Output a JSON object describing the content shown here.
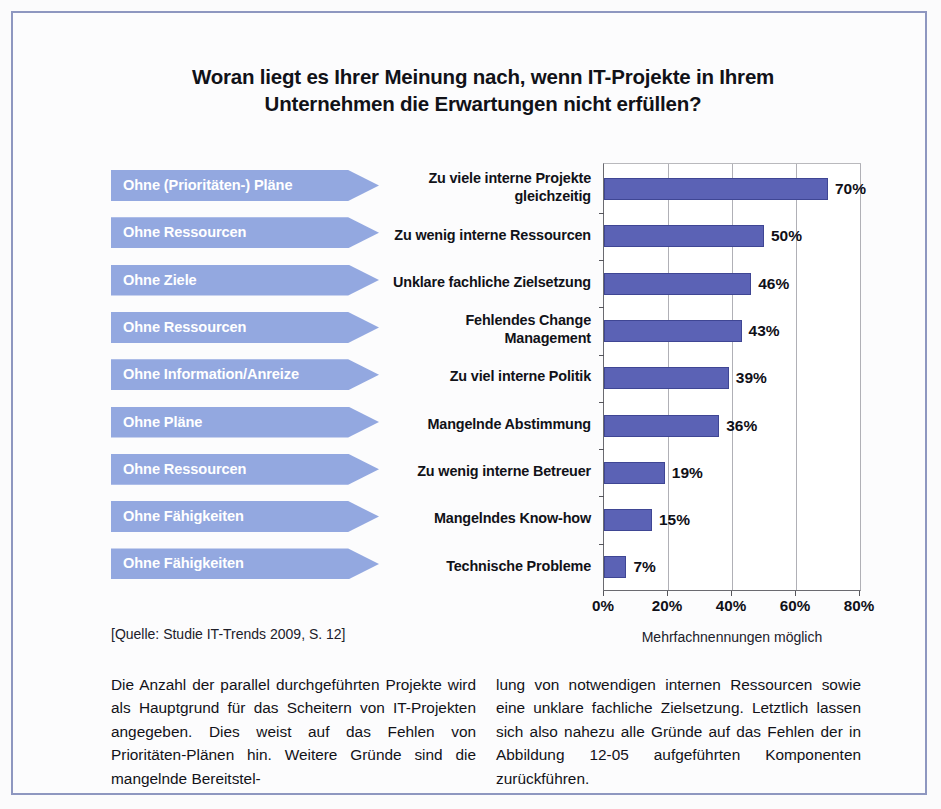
{
  "figure": {
    "title": "Woran liegt es Ihrer Meinung nach, wenn IT-Projekte in Ihrem Unternehmen die Erwartungen nicht erfüllen?",
    "title_line1": "Woran liegt es Ihrer Meinung nach, wenn IT-Projekte in Ihrem",
    "title_line2": "Unternehmen die Erwartungen nicht erfüllen?",
    "source": "[Quelle: Studie IT-Trends 2009, S. 12]",
    "axis_note": "Mehrfachnennungen möglich"
  },
  "arrows": [
    {
      "label": "Ohne (Prioritäten-) Pläne"
    },
    {
      "label": "Ohne Ressourcen"
    },
    {
      "label": "Ohne Ziele"
    },
    {
      "label": "Ohne Ressourcen"
    },
    {
      "label": "Ohne Information/Anreize"
    },
    {
      "label": "Ohne Pläne"
    },
    {
      "label": "Ohne Ressourcen"
    },
    {
      "label": "Ohne Fähigkeiten"
    },
    {
      "label": "Ohne Fähigkeiten"
    }
  ],
  "chart_data": {
    "type": "bar",
    "orientation": "horizontal",
    "title": "Woran liegt es Ihrer Meinung nach, wenn IT-Projekte in Ihrem Unternehmen die Erwartungen nicht erfüllen?",
    "xlabel": "",
    "ylabel": "",
    "xlim": [
      0,
      80
    ],
    "grid": true,
    "legend": null,
    "note": "Mehrfachnennungen möglich",
    "xticks": [
      "0%",
      "20%",
      "40%",
      "60%",
      "80%"
    ],
    "xtick_values": [
      0,
      20,
      40,
      60,
      80
    ],
    "categories": [
      "Zu viele interne Projekte gleichzeitig",
      "Zu wenig interne Ressourcen",
      "Unklare fachliche Zielsetzung",
      "Fehlendes Change Management",
      "Zu viel interne Politik",
      "Mangelnde Abstimmung",
      "Zu wenig interne Betreuer",
      "Mangelndes Know-how",
      "Technische Probleme"
    ],
    "category_lines": [
      [
        "Zu viele interne Projekte",
        "gleichzeitig"
      ],
      [
        "Zu wenig interne Ressourcen"
      ],
      [
        "Unklare fachliche Zielsetzung"
      ],
      [
        "Fehlendes Change",
        "Management"
      ],
      [
        "Zu viel interne Politik"
      ],
      [
        "Mangelnde Abstimmung"
      ],
      [
        "Zu wenig interne Betreuer"
      ],
      [
        "Mangelndes Know-how"
      ],
      [
        "Technische Probleme"
      ]
    ],
    "values": [
      70,
      50,
      46,
      43,
      39,
      36,
      19,
      15,
      7
    ],
    "value_labels": [
      "70%",
      "50%",
      "46%",
      "43%",
      "39%",
      "36%",
      "19%",
      "15%",
      "7%"
    ],
    "bar_color": "#5b62b5",
    "arrow_color": "#93a8e0"
  },
  "body": {
    "left_column": "Die Anzahl der parallel durchgeführten Projekte wird als Hauptgrund für das Scheitern von IT-Projekten angegeben. Dies weist auf das Fehlen von Prioritäten-Plänen hin. Weitere Gründe sind die mangelnde Bereitstel-",
    "right_column": "lung von notwendigen internen Ressourcen sowie eine unklare fachliche Zielsetzung. Letztlich lassen sich also nahezu alle Gründe auf das Fehlen der in Abbildung 12-05 aufgeführten Komponenten zurückführen."
  }
}
